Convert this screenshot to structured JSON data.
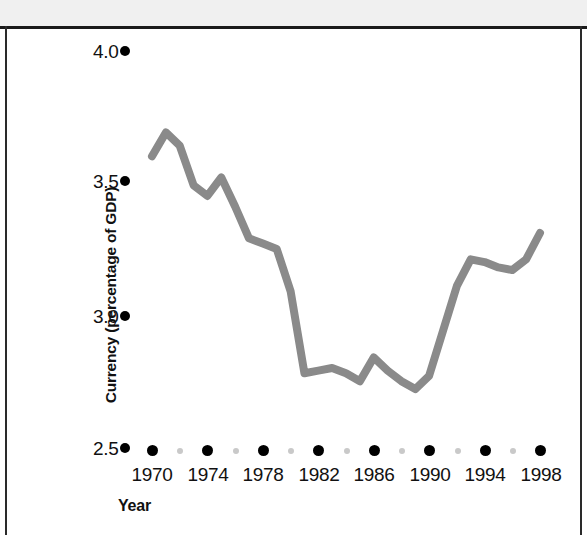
{
  "chart_data": {
    "type": "line",
    "title": "",
    "xlabel": "Year",
    "ylabel": "Currency (percentage of GDP)",
    "xlim": [
      1969,
      1999
    ],
    "ylim": [
      2.5,
      4.0
    ],
    "grid": false,
    "legend": null,
    "line_color": "#8a8a8a",
    "axis_color": "#000000",
    "y_ticks": [
      "2.5",
      "3.0",
      "3.5",
      "4.0"
    ],
    "y_tick_values": [
      2.5,
      3.0,
      3.5,
      4.0
    ],
    "x_ticks": [
      "1970",
      "1974",
      "1978",
      "1982",
      "1986",
      "1990",
      "1994",
      "1998"
    ],
    "x_tick_values": [
      1970,
      1974,
      1978,
      1982,
      1986,
      1990,
      1994,
      1998
    ],
    "x_minor_tick_values": [
      1972,
      1976,
      1980,
      1984,
      1988,
      1992,
      1996
    ],
    "x": [
      1970,
      1971,
      1972,
      1973,
      1974,
      1975,
      1976,
      1977,
      1978,
      1979,
      1980,
      1981,
      1982,
      1983,
      1984,
      1985,
      1986,
      1987,
      1988,
      1989,
      1990,
      1991,
      1992,
      1993,
      1994,
      1995,
      1996,
      1997,
      1998
    ],
    "values": [
      3.61,
      3.7,
      3.65,
      3.5,
      3.46,
      3.53,
      3.42,
      3.3,
      3.28,
      3.26,
      3.1,
      2.79,
      2.8,
      2.81,
      2.79,
      2.76,
      2.85,
      2.8,
      2.76,
      2.73,
      2.78,
      2.95,
      3.12,
      3.22,
      3.21,
      3.19,
      3.18,
      3.22,
      3.32
    ],
    "series_name": "Currency"
  },
  "axes": {
    "y_title": "Currency (percentage of GDP)",
    "x_title": "Year"
  }
}
